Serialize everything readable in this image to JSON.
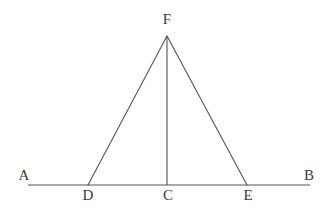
{
  "figure": {
    "canvas": {
      "width": 329,
      "height": 218
    },
    "background_color": "#ffffff",
    "stroke_color": "#555555",
    "label_color": "#3a3a3a",
    "stroke_width": 1.1,
    "points": {
      "A": {
        "x": 28,
        "y": 185
      },
      "B": {
        "x": 310,
        "y": 185
      },
      "C": {
        "x": 167,
        "y": 185
      },
      "D": {
        "x": 88,
        "y": 185
      },
      "E": {
        "x": 247,
        "y": 185
      },
      "F": {
        "x": 167,
        "y": 36
      }
    },
    "segments": [
      {
        "name": "baseline-AB",
        "from": "A",
        "to": "B"
      },
      {
        "name": "side-FD",
        "from": "F",
        "to": "D"
      },
      {
        "name": "side-FE",
        "from": "F",
        "to": "E"
      },
      {
        "name": "altitude-FC",
        "from": "F",
        "to": "C"
      }
    ],
    "labels": [
      {
        "id": "A",
        "text": "A",
        "x": 24,
        "y": 175
      },
      {
        "id": "B",
        "text": "B",
        "x": 309,
        "y": 175
      },
      {
        "id": "F",
        "text": "F",
        "x": 167,
        "y": 19
      },
      {
        "id": "D",
        "text": "D",
        "x": 88,
        "y": 195
      },
      {
        "id": "C",
        "text": "C",
        "x": 168,
        "y": 195
      },
      {
        "id": "E",
        "text": "E",
        "x": 248,
        "y": 195
      }
    ]
  }
}
